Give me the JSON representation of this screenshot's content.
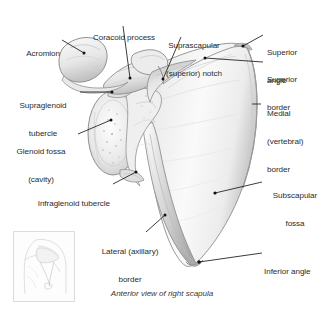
{
  "figure": {
    "title": "Anterior view of right scapula",
    "caption": "Anterior view of right scapula",
    "background_color": "#ffffff",
    "text_color": "#2b2b2b",
    "line_color": "#1a1a1a",
    "bone_fill": "#f4f4f4",
    "bone_outline": "#8d8d8d",
    "bone_shadow": "#b9b9b9"
  },
  "labels": [
    {
      "id": "acromion",
      "text": "Acromion",
      "lines": [
        "Acromion"
      ]
    },
    {
      "id": "coracoid-process",
      "text": "Coracoid process",
      "lines": [
        "Coracoid process"
      ]
    },
    {
      "id": "suprascapular-notch",
      "text": "Suprascapular (superior) notch",
      "lines": [
        "Suprascapular",
        "(superior) notch"
      ]
    },
    {
      "id": "superior-angle",
      "text": "Superior angle",
      "lines": [
        "Superior",
        "angle"
      ]
    },
    {
      "id": "superior-border",
      "text": "Superior border",
      "lines": [
        "Superior",
        "border"
      ]
    },
    {
      "id": "medial-border",
      "text": "Medial (vertebral) border",
      "lines": [
        "Medial",
        "(vertebral)",
        "border"
      ]
    },
    {
      "id": "supraglenoid-tubercle",
      "text": "Supraglenoid tubercle",
      "lines": [
        "Supraglenoid",
        "tubercle"
      ]
    },
    {
      "id": "glenoid-fossa",
      "text": "Glenoid fossa (cavity)",
      "lines": [
        "Glenoid fossa",
        "(cavity)"
      ]
    },
    {
      "id": "infraglenoid-tubercle",
      "text": "Infraglenoid tubercle",
      "lines": [
        "Infraglenoid tubercle"
      ]
    },
    {
      "id": "lateral-border",
      "text": "Lateral (axillary) border",
      "lines": [
        "Lateral (axillary)",
        "border"
      ]
    },
    {
      "id": "subscapular-fossa",
      "text": "Subscapular fossa",
      "lines": [
        "Subscapular",
        "fossa"
      ]
    },
    {
      "id": "inferior-angle",
      "text": "Inferior angle",
      "lines": [
        "Inferior angle"
      ]
    }
  ],
  "inset": {
    "name": "orientation-thumbnail",
    "description": "Faint anterior torso and shoulder showing scapula location"
  }
}
